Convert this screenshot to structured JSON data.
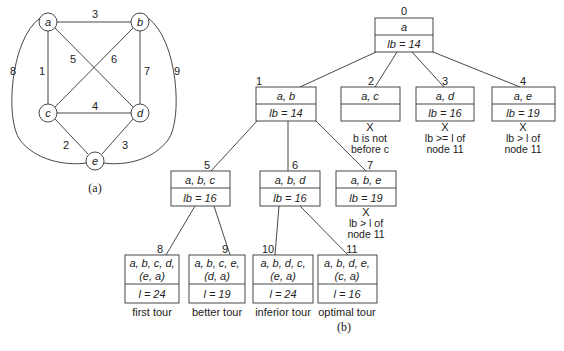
{
  "graph": {
    "caption": "(a)",
    "nodes": [
      {
        "id": "a",
        "label": "a",
        "x": 48,
        "y": 22
      },
      {
        "id": "b",
        "label": "b",
        "x": 140,
        "y": 22
      },
      {
        "id": "c",
        "label": "c",
        "x": 48,
        "y": 113
      },
      {
        "id": "d",
        "label": "d",
        "x": 140,
        "y": 113
      },
      {
        "id": "e",
        "label": "e",
        "x": 95,
        "y": 160
      }
    ],
    "edges": [
      {
        "from": "a",
        "to": "b",
        "weight": "3"
      },
      {
        "from": "a",
        "to": "c",
        "weight": "1"
      },
      {
        "from": "a",
        "to": "d",
        "weight": "5"
      },
      {
        "from": "a",
        "to": "e",
        "weight": "8"
      },
      {
        "from": "b",
        "to": "c",
        "weight": "6"
      },
      {
        "from": "b",
        "to": "d",
        "weight": "7"
      },
      {
        "from": "b",
        "to": "e",
        "weight": "9"
      },
      {
        "from": "c",
        "to": "d",
        "weight": "4"
      },
      {
        "from": "c",
        "to": "e",
        "weight": "2"
      },
      {
        "from": "d",
        "to": "e",
        "weight": "3"
      }
    ]
  },
  "tree": {
    "caption": "(b)",
    "nodes": [
      {
        "id": "0",
        "path": "a",
        "bound": "lb = 14"
      },
      {
        "id": "1",
        "path": "a, b",
        "bound": "lb = 14"
      },
      {
        "id": "2",
        "path": "a, c",
        "bound": "",
        "pruned": "X",
        "note1": "b is not",
        "note2": "before c"
      },
      {
        "id": "3",
        "path": "a, d",
        "bound": "lb = 16",
        "pruned": "X",
        "note1": "lb >= l of",
        "note2": "node 11"
      },
      {
        "id": "4",
        "path": "a, e",
        "bound": "lb = 19",
        "pruned": "X",
        "note1": "lb > l of",
        "note2": "node 11"
      },
      {
        "id": "5",
        "path": "a, b, c",
        "bound": "lb = 16"
      },
      {
        "id": "6",
        "path": "a, b, d",
        "bound": "lb = 16"
      },
      {
        "id": "7",
        "path": "a, b, e",
        "bound": "lb = 19",
        "pruned": "X",
        "note1": "lb > l of",
        "note2": "node 11"
      },
      {
        "id": "8",
        "path1": "a, b, c, d,",
        "path2": "(e, a)",
        "bound": "l = 24",
        "label": "first tour"
      },
      {
        "id": "9",
        "path1": "a, b, c, e,",
        "path2": "(d, a)",
        "bound": "l = 19",
        "label": "better tour"
      },
      {
        "id": "10",
        "path1": "a, b, d, c,",
        "path2": "(e, a)",
        "bound": "l = 24",
        "label": "inferior tour"
      },
      {
        "id": "11",
        "path1": "a, b, d, e,",
        "path2": "(c, a)",
        "bound": "l = 16",
        "label": "optimal tour"
      }
    ]
  }
}
